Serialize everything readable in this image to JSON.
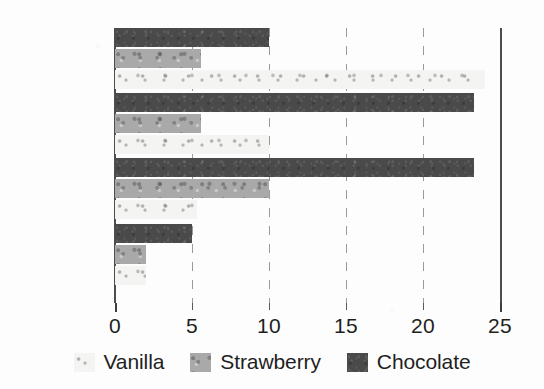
{
  "chart_data": {
    "type": "bar",
    "orientation": "horizontal",
    "title": "",
    "xlabel": "",
    "ylabel": "",
    "categories": [
      "Pedro",
      "Benjamin",
      "Nicole",
      "Susan"
    ],
    "series": [
      {
        "name": "Vanilla",
        "color": "#f4f4f2",
        "values": [
          24,
          10,
          5.3,
          2
        ]
      },
      {
        "name": "Strawberry",
        "color": "#a9a9a9",
        "values": [
          5.6,
          5.6,
          10,
          2
        ]
      },
      {
        "name": "Chocolate",
        "color": "#4a4a4a",
        "values": [
          10,
          23.3,
          23.3,
          5
        ]
      }
    ],
    "series_draw_order_top_to_bottom": [
      "Chocolate",
      "Strawberry",
      "Vanilla"
    ],
    "xlim": [
      0,
      25
    ],
    "xticks": [
      0,
      5,
      10,
      15,
      20,
      25
    ],
    "xtick_labels": [
      "0",
      "5",
      "10",
      "15",
      "20",
      "25"
    ],
    "grid": true,
    "gridline_style": "dashed",
    "legend_position": "bottom"
  },
  "legend": {
    "items": [
      {
        "label": "Vanilla",
        "swatch": "vanilla-swatch"
      },
      {
        "label": "Strawberry",
        "swatch": "strawberry-swatch"
      },
      {
        "label": "Chocolate",
        "swatch": "chocolate-swatch"
      }
    ]
  }
}
